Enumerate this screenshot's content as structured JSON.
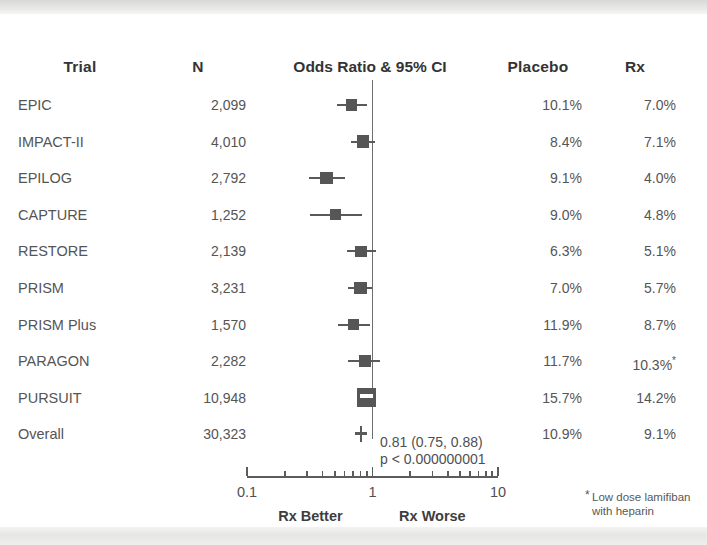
{
  "figure": {
    "columns": {
      "trial": "Trial",
      "n": "N",
      "odds_ratio": "Odds Ratio & 95% CI",
      "placebo": "Placebo",
      "rx": "Rx"
    },
    "axis": {
      "min_label": "0.1",
      "mid_label": "1",
      "max_label": "10",
      "left_direction": "Rx Better",
      "right_direction": "Rx Worse"
    },
    "summary": {
      "estimate": "0.81 (0.75, 0.88)",
      "pvalue": "p < 0.000000001"
    },
    "footnote": {
      "marker": "*",
      "text": "Low dose lamifiban\nwith heparin"
    },
    "colors": {
      "marker": "#565656",
      "line": "#5a5a5a",
      "text": "#555555",
      "header_text": "#333333",
      "band": "#e6e6e4"
    }
  },
  "chart_data": {
    "type": "forest",
    "title": "Odds Ratio & 95% CI",
    "xlabel": "Odds Ratio",
    "xscale": "log",
    "xlim": [
      0.1,
      10
    ],
    "xticks": [
      0.1,
      1,
      10
    ],
    "null_value": 1,
    "grid": false,
    "columns": [
      "Trial",
      "N",
      "Odds Ratio & 95% CI",
      "Placebo",
      "Rx"
    ],
    "rows": [
      {
        "trial": "EPIC",
        "n": "2,099",
        "or": 0.68,
        "ci_low": 0.52,
        "ci_high": 0.9,
        "placebo": "10.1%",
        "rx": "7.0%",
        "weight": 0.34,
        "note": ""
      },
      {
        "trial": "IMPACT-II",
        "n": "4,010",
        "or": 0.84,
        "ci_low": 0.67,
        "ci_high": 1.05,
        "placebo": "8.4%",
        "rx": "7.1%",
        "weight": 0.42,
        "note": ""
      },
      {
        "trial": "EPILOG",
        "n": "2,792",
        "or": 0.43,
        "ci_low": 0.31,
        "ci_high": 0.6,
        "placebo": "9.1%",
        "rx": "4.0%",
        "weight": 0.38,
        "note": ""
      },
      {
        "trial": "CAPTURE",
        "n": "1,252",
        "or": 0.51,
        "ci_low": 0.32,
        "ci_high": 0.82,
        "placebo": "9.0%",
        "rx": "4.8%",
        "weight": 0.24,
        "note": ""
      },
      {
        "trial": "RESTORE",
        "n": "2,139",
        "or": 0.81,
        "ci_low": 0.63,
        "ci_high": 1.06,
        "placebo": "6.3%",
        "rx": "5.1%",
        "weight": 0.33,
        "note": ""
      },
      {
        "trial": "PRISM",
        "n": "3,231",
        "or": 0.8,
        "ci_low": 0.64,
        "ci_high": 1.0,
        "placebo": "7.0%",
        "rx": "5.7%",
        "weight": 0.4,
        "note": ""
      },
      {
        "trial": "PRISM Plus",
        "n": "1,570",
        "or": 0.71,
        "ci_low": 0.53,
        "ci_high": 0.96,
        "placebo": "11.9%",
        "rx": "8.7%",
        "weight": 0.26,
        "note": ""
      },
      {
        "trial": "PARAGON",
        "n": "2,282",
        "or": 0.87,
        "ci_low": 0.64,
        "ci_high": 1.14,
        "placebo": "11.7%",
        "rx": "10.3%",
        "weight": 0.33,
        "note": "*"
      },
      {
        "trial": "PURSUIT",
        "n": "10,948",
        "or": 0.9,
        "ci_low": 0.83,
        "ci_high": 0.98,
        "placebo": "15.7%",
        "rx": "14.2%",
        "weight": 1.0,
        "note": ""
      },
      {
        "trial": "Overall",
        "n": "30,323",
        "or": 0.81,
        "ci_low": 0.75,
        "ci_high": 0.88,
        "placebo": "10.9%",
        "rx": "9.1%",
        "weight": 0.0,
        "note": "",
        "summary": true
      }
    ]
  }
}
